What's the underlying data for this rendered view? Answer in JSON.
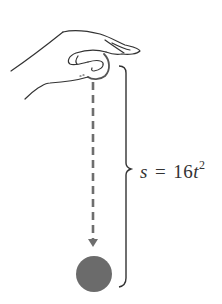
{
  "figure": {
    "equation": {
      "lhs": "s",
      "equals": "=",
      "coefficient": "16",
      "variable": "t",
      "exponent": "2"
    },
    "colors": {
      "line": "#333333",
      "dashed": "#6e6e6e",
      "ball": "#6b6b6b",
      "background": "#ffffff"
    }
  }
}
